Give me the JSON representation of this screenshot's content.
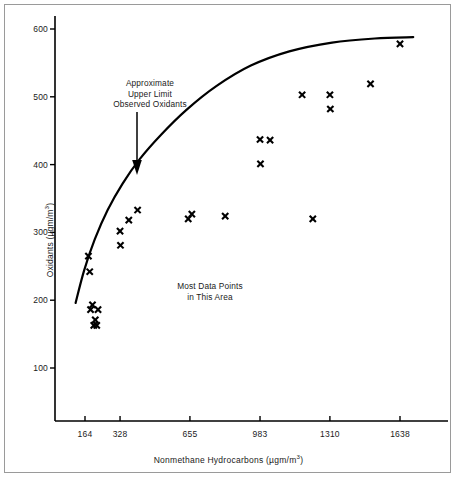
{
  "chart_data": {
    "type": "scatter",
    "title": "",
    "xlabel": "Nonmethane Hydrocarbons  (µgm/m³)",
    "ylabel": "Oxidants (µgm/m³)",
    "xlabel_main": "Nonmethane Hydrocarbons  (µgm/m",
    "xlabel_sup": "3",
    "xlabel_tail": ")",
    "ylabel_main": "Oxidants (µgm/m",
    "ylabel_sup": "3",
    "ylabel_tail": ")",
    "xlim": [
      0,
      1760
    ],
    "ylim": [
      0,
      640
    ],
    "grid": false,
    "legend": "none",
    "xticks": [
      164,
      328,
      655,
      983,
      1310,
      1638
    ],
    "xtick_labels": [
      "164",
      "328",
      "655",
      "983",
      "1310",
      "1638"
    ],
    "yticks": [
      100,
      200,
      300,
      400,
      500,
      600
    ],
    "ytick_labels": [
      "100",
      "200",
      "300",
      "400",
      "500",
      "600"
    ],
    "series": [
      {
        "name": "Observed oxidant measurements",
        "marker": "x",
        "color": "#000000",
        "points": [
          [
            180,
            265
          ],
          [
            186,
            242
          ],
          [
            190,
            186
          ],
          [
            199,
            193
          ],
          [
            205,
            163
          ],
          [
            212,
            171
          ],
          [
            219,
            163
          ],
          [
            225,
            186
          ],
          [
            328,
            302
          ],
          [
            330,
            281
          ],
          [
            369,
            318
          ],
          [
            410,
            333
          ],
          [
            647,
            320
          ],
          [
            664,
            327
          ],
          [
            820,
            324
          ],
          [
            983,
            437
          ],
          [
            985,
            401
          ],
          [
            1030,
            436
          ],
          [
            1180,
            503
          ],
          [
            1230,
            320
          ],
          [
            1310,
            503
          ],
          [
            1312,
            482
          ],
          [
            1500,
            519
          ],
          [
            1638,
            578
          ]
        ]
      }
    ],
    "curves": [
      {
        "name": "Approximate upper limit observed oxidants",
        "style": "solid",
        "color": "#000000",
        "width": 2.2,
        "points": [
          [
            120,
            196
          ],
          [
            160,
            244
          ],
          [
            210,
            290
          ],
          [
            270,
            333
          ],
          [
            340,
            372
          ],
          [
            420,
            408
          ],
          [
            520,
            444
          ],
          [
            640,
            481
          ],
          [
            780,
            516
          ],
          [
            940,
            546
          ],
          [
            1120,
            567
          ],
          [
            1320,
            580
          ],
          [
            1520,
            586
          ],
          [
            1700,
            588
          ]
        ]
      }
    ],
    "annotations": [
      {
        "id": "upper-limit",
        "lines": [
          "Approximate",
          "Upper Limit",
          "Observed Oxidants"
        ],
        "arrow": {
          "from": [
            385,
            480
          ],
          "to": [
            385,
            400
          ],
          "head": "down"
        }
      },
      {
        "id": "most-data",
        "lines": [
          "Most Data Points",
          "in This Area"
        ]
      }
    ]
  },
  "axes": {
    "y_ticks": [
      {
        "value": 600,
        "label": "600"
      },
      {
        "value": 500,
        "label": "500"
      },
      {
        "value": 400,
        "label": "400"
      },
      {
        "value": 300,
        "label": "300"
      },
      {
        "value": 200,
        "label": "200"
      },
      {
        "value": 100,
        "label": "100"
      }
    ],
    "x_ticks": [
      {
        "value": 164,
        "label": "164"
      },
      {
        "value": 328,
        "label": "328"
      },
      {
        "value": 655,
        "label": "655"
      },
      {
        "value": 983,
        "label": "983"
      },
      {
        "value": 1310,
        "label": "1310"
      },
      {
        "value": 1638,
        "label": "1638"
      }
    ]
  },
  "annotations": {
    "upper_limit": {
      "line1": "Approximate",
      "line2": "Upper Limit",
      "line3": "Observed Oxidants"
    },
    "most_data": {
      "line1": "Most Data Points",
      "line2": "in This Area"
    }
  },
  "colors": {
    "axis": "#000000",
    "marker": "#000000",
    "curve": "#000000",
    "frame": "#9a9a9a",
    "background": "#ffffff",
    "text": "#1a1a1a"
  }
}
